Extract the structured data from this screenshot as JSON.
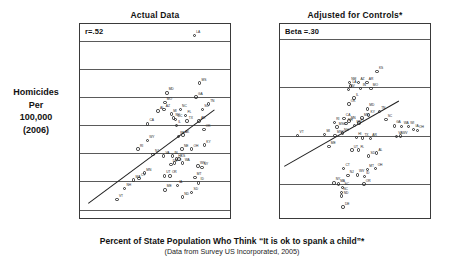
{
  "figure": {
    "xaxis_title": "Percent of State Population Who Think “It is ok to spank a child”*",
    "xaxis_subtitle": "(Data from Survey US Incorporated, 2005)",
    "ylabel_lines": [
      "Homicides",
      "Per",
      "100,000",
      "(2006)"
    ]
  },
  "chart_data": [
    {
      "type": "scatter",
      "title": "Actual Data",
      "annotation": "r=.52",
      "xlabel": "Percent of State Population Who Think “It is ok to spank a child”*",
      "ylabel": "Homicides Per 100,000 (2006)",
      "xlim": [
        46,
        93
      ],
      "ylim": [
        -0.6,
        13.2
      ],
      "xticks": [
        50,
        60,
        70,
        80,
        90
      ],
      "xtick_labels": [
        "50",
        "60",
        "70",
        "80",
        "90"
      ],
      "yticks": [
        0,
        2,
        4,
        6,
        8,
        10,
        12
      ],
      "ytick_labels": [
        "0.00",
        "2.00",
        "4.00",
        "6.00",
        "8.00",
        "10.00",
        "12.00"
      ],
      "grid": "horizontal",
      "legend": "none",
      "trendline": {
        "x1": 48.5,
        "y1": 0.45,
        "x2": 88.0,
        "y2": 7.1
      },
      "points": [
        {
          "label": "LA",
          "x": 81.8,
          "y": 12.4
        },
        {
          "label": "MS",
          "x": 83.5,
          "y": 9.0
        },
        {
          "label": "MD",
          "x": 73.2,
          "y": 8.3
        },
        {
          "label": "GA",
          "x": 82.4,
          "y": 8.0
        },
        {
          "label": "MO",
          "x": 72.6,
          "y": 7.6
        },
        {
          "label": "TN",
          "x": 86.2,
          "y": 7.5
        },
        {
          "label": "AL",
          "x": 70.5,
          "y": 7.0
        },
        {
          "label": "AZ",
          "x": 72.3,
          "y": 7.1
        },
        {
          "label": "SC",
          "x": 84.3,
          "y": 7.1
        },
        {
          "label": "NC",
          "x": 77.4,
          "y": 7.1
        },
        {
          "label": "MI",
          "x": 74.6,
          "y": 6.8
        },
        {
          "label": "FL",
          "x": 79.1,
          "y": 6.7
        },
        {
          "label": "NV",
          "x": 75.3,
          "y": 6.5
        },
        {
          "label": "DC",
          "x": 76.0,
          "y": 6.4
        },
        {
          "label": "TX",
          "x": 79.5,
          "y": 6.3
        },
        {
          "label": "AR",
          "x": 83.3,
          "y": 6.3
        },
        {
          "label": "CA",
          "x": 67.2,
          "y": 6.1
        },
        {
          "label": "IL",
          "x": 76.2,
          "y": 6.0
        },
        {
          "label": "OK",
          "x": 84.8,
          "y": 5.7
        },
        {
          "label": "AK",
          "x": 78.3,
          "y": 5.3
        },
        {
          "label": "PA",
          "x": 76.8,
          "y": 5.2
        },
        {
          "label": "WY",
          "x": 67.1,
          "y": 4.9
        },
        {
          "label": "KY",
          "x": 85.0,
          "y": 4.6
        },
        {
          "label": "RI",
          "x": 64.2,
          "y": 4.3
        },
        {
          "label": "NE",
          "x": 78.0,
          "y": 4.3
        },
        {
          "label": "OH",
          "x": 81.0,
          "y": 4.3
        },
        {
          "label": "NJ",
          "x": 68.9,
          "y": 3.9
        },
        {
          "label": "VA",
          "x": 72.2,
          "y": 3.8
        },
        {
          "label": "IN",
          "x": 75.0,
          "y": 3.8
        },
        {
          "label": "KS",
          "x": 77.0,
          "y": 3.6
        },
        {
          "label": "HI",
          "x": 76.2,
          "y": 3.6
        },
        {
          "label": "CO",
          "x": 75.6,
          "y": 3.3
        },
        {
          "label": "WA",
          "x": 78.2,
          "y": 3.3
        },
        {
          "label": "WV",
          "x": 83.0,
          "y": 3.1
        },
        {
          "label": "DE",
          "x": 74.5,
          "y": 3.2
        },
        {
          "label": "NY",
          "x": 84.2,
          "y": 3.0
        },
        {
          "label": "MN",
          "x": 66.2,
          "y": 2.6
        },
        {
          "label": "CT",
          "x": 64.5,
          "y": 2.2
        },
        {
          "label": "MA",
          "x": 62.8,
          "y": 2.1
        },
        {
          "label": "UT",
          "x": 72.4,
          "y": 2.4
        },
        {
          "label": "OR",
          "x": 74.2,
          "y": 2.4
        },
        {
          "label": "MT",
          "x": 82.0,
          "y": 2.3
        },
        {
          "label": "ID",
          "x": 83.2,
          "y": 1.9
        },
        {
          "label": "NH",
          "x": 60.0,
          "y": 1.5
        },
        {
          "label": "ME",
          "x": 72.6,
          "y": 1.4
        },
        {
          "label": "IA",
          "x": 76.5,
          "y": 1.7
        },
        {
          "label": "SD",
          "x": 81.0,
          "y": 1.2
        },
        {
          "label": "ND",
          "x": 78.1,
          "y": 0.9
        },
        {
          "label": "VT",
          "x": 57.6,
          "y": 0.7
        }
      ]
    },
    {
      "type": "scatter",
      "title": "Adjusted for Controls*",
      "annotation": "Beta =.30",
      "xlim": [
        -17.5,
        16.5
      ],
      "ylim": [
        -3.4,
        4.6
      ],
      "xticks": [
        -15,
        -10,
        -5,
        0,
        5,
        10,
        15
      ],
      "xtick_labels": [
        "-15",
        "-10",
        "-5",
        "0",
        "5",
        "10",
        "15"
      ],
      "yticks": [
        -2,
        0,
        2,
        4
      ],
      "ytick_labels": [
        "-2.00",
        "0.00",
        "2.00",
        "4.00"
      ],
      "grid": "horizontal",
      "legend": "none",
      "trendline": {
        "x1": -16.5,
        "y1": -1.25,
        "x2": 9.5,
        "y2": 1.45
      },
      "points": [
        {
          "label": "KS",
          "x": 4.5,
          "y": 2.65
        },
        {
          "label": "NM",
          "x": -1.8,
          "y": 2.18
        },
        {
          "label": "AZ",
          "x": 0.3,
          "y": 2.2
        },
        {
          "label": "AR",
          "x": 2.2,
          "y": 2.18
        },
        {
          "label": "LA",
          "x": -1.5,
          "y": 2.05
        },
        {
          "label": "NV",
          "x": -2.0,
          "y": 1.9
        },
        {
          "label": "IN",
          "x": 0.8,
          "y": 1.95
        },
        {
          "label": "MO",
          "x": 3.1,
          "y": 1.95
        },
        {
          "label": "IL",
          "x": -0.7,
          "y": 1.55
        },
        {
          "label": "OK",
          "x": -1.9,
          "y": 1.3
        },
        {
          "label": "MD",
          "x": 2.3,
          "y": 1.1
        },
        {
          "label": "TN",
          "x": 5.0,
          "y": 1.0
        },
        {
          "label": "KY",
          "x": 2.6,
          "y": 0.85
        },
        {
          "label": "CA",
          "x": -3.0,
          "y": 0.7
        },
        {
          "label": "MN",
          "x": -1.9,
          "y": 0.6
        },
        {
          "label": "MS",
          "x": 1.1,
          "y": 0.72
        },
        {
          "label": "SC",
          "x": 6.5,
          "y": 0.65
        },
        {
          "label": "RI",
          "x": -5.2,
          "y": 0.55
        },
        {
          "label": "NH",
          "x": -2.5,
          "y": 0.5
        },
        {
          "label": "FL",
          "x": 0.4,
          "y": 0.52
        },
        {
          "label": "MSO",
          "x": -4.6,
          "y": 0.35
        },
        {
          "label": "MN2",
          "x": -0.6,
          "y": 0.42
        },
        {
          "label": "GA",
          "x": 8.4,
          "y": 0.4
        },
        {
          "label": "WA",
          "x": 10.1,
          "y": 0.38
        },
        {
          "label": "WI",
          "x": 11.6,
          "y": 0.38
        },
        {
          "label": "VT",
          "x": -13.5,
          "y": 0.0
        },
        {
          "label": "MI",
          "x": -7.4,
          "y": 0.05
        },
        {
          "label": "MSC",
          "x": -5.0,
          "y": 0.0
        },
        {
          "label": "NH2",
          "x": -3.4,
          "y": 0.1
        },
        {
          "label": "HI",
          "x": -0.2,
          "y": -0.08
        },
        {
          "label": "TX",
          "x": 1.2,
          "y": -0.1
        },
        {
          "label": "AR2",
          "x": 3.0,
          "y": -0.12
        },
        {
          "label": "VA",
          "x": 8.9,
          "y": -0.05
        },
        {
          "label": "WV",
          "x": 9.8,
          "y": -0.02
        },
        {
          "label": "IA",
          "x": 12.8,
          "y": 0.25
        },
        {
          "label": "OH",
          "x": 13.6,
          "y": 0.22
        },
        {
          "label": "ME",
          "x": -6.4,
          "y": -0.45
        },
        {
          "label": "UT",
          "x": -1.2,
          "y": -0.6
        },
        {
          "label": "FL2",
          "x": 0.3,
          "y": -0.6
        },
        {
          "label": "SD",
          "x": 2.6,
          "y": -0.85
        },
        {
          "label": "AL",
          "x": 4.4,
          "y": -0.72
        },
        {
          "label": "CT",
          "x": -3.1,
          "y": -1.35
        },
        {
          "label": "MT",
          "x": 2.3,
          "y": -1.4
        },
        {
          "label": "OH2",
          "x": 4.2,
          "y": -1.35
        },
        {
          "label": "NJ",
          "x": -2.1,
          "y": -1.65
        },
        {
          "label": "WV2",
          "x": 0.0,
          "y": -1.62
        },
        {
          "label": "ID",
          "x": 1.6,
          "y": -1.7
        },
        {
          "label": "OR",
          "x": 1.5,
          "y": -2.0
        },
        {
          "label": "NY",
          "x": -5.3,
          "y": -1.95
        },
        {
          "label": "MA",
          "x": -4.3,
          "y": -2.0
        },
        {
          "label": "SC2",
          "x": -3.3,
          "y": -2.15
        },
        {
          "label": "NC",
          "x": -3.6,
          "y": -2.35
        },
        {
          "label": "ND",
          "x": -3.5,
          "y": -2.5
        },
        {
          "label": "DE",
          "x": -3.2,
          "y": -2.95
        }
      ]
    }
  ]
}
